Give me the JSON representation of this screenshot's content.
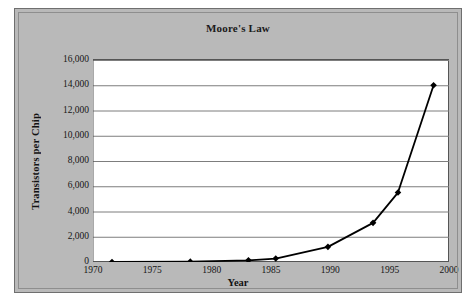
{
  "chart_data": {
    "type": "line",
    "title": "Moore's Law",
    "xlabel": "Year",
    "ylabel": "Transistors per Chip",
    "xlim": [
      1970,
      2000
    ],
    "ylim": [
      0,
      16000
    ],
    "grid": "horizontal",
    "legend": "none",
    "marker": "diamond",
    "series": [
      {
        "name": "Transistors per Chip",
        "x": [
          1971.6,
          1978.2,
          1983.1,
          1985.4,
          1989.8,
          1993.6,
          1995.7,
          1998.7
        ],
        "values": [
          2.3,
          29,
          134,
          275,
          1200,
          3100,
          5500,
          14000
        ]
      }
    ],
    "xticks": [
      1970,
      1975,
      1980,
      1985,
      1990,
      1995,
      2000
    ],
    "xtick_labels": [
      "1970",
      "1975",
      "1980",
      "1985",
      "1990",
      "1995",
      "2000"
    ],
    "yticks": [
      0,
      2000,
      4000,
      6000,
      8000,
      10000,
      12000,
      14000,
      16000
    ],
    "ytick_labels": [
      "0",
      "2,000",
      "4,000",
      "6,000",
      "8,000",
      "10,000",
      "12,000",
      "14,000",
      "16,000"
    ],
    "colors": {
      "line": "#000000",
      "marker": "#000000",
      "plot_background": "#ffffff",
      "chart_background": "#b9b9b9",
      "gridline": "#7d7d7d",
      "axis": "#555555",
      "text": "#141414"
    }
  }
}
